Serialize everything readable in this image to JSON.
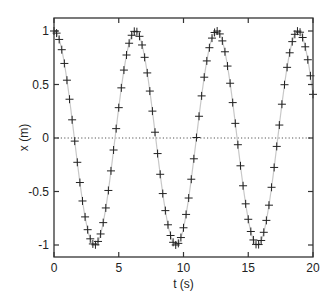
{
  "chart_data": {
    "type": "line",
    "title": "",
    "xlabel": "t (s)",
    "ylabel": "x (m)",
    "xlim": [
      0,
      20
    ],
    "ylim": [
      -1.1,
      1.1
    ],
    "xticks": [
      0,
      5,
      10,
      15,
      20
    ],
    "xtick_labels": [
      "0",
      "5",
      "10",
      "15",
      "20"
    ],
    "yticks": [
      1,
      0.5,
      0,
      -0.5,
      -1
    ],
    "ytick_labels": [
      "1",
      "0.5",
      "0",
      "-0.5",
      "-1"
    ],
    "grid": false,
    "legend": null,
    "reference_line": {
      "y": 0,
      "style": "dotted"
    },
    "series": [
      {
        "name": "curve",
        "style": "line",
        "color": "#c8c8c8",
        "function": "cos(t)",
        "x_range": [
          0,
          20
        ]
      },
      {
        "name": "samples",
        "style": "markers",
        "marker": "+",
        "color": "#222222",
        "function": "cos(t)",
        "x_start": 0,
        "x_step": 0.2,
        "x_end": 20
      }
    ]
  },
  "axes": {
    "x_label": "t (s)",
    "y_label": "x (m)"
  },
  "colors": {
    "frame": "#333333",
    "curve": "#c8c8c8",
    "markers": "#222222",
    "zero_line": "#555555"
  }
}
